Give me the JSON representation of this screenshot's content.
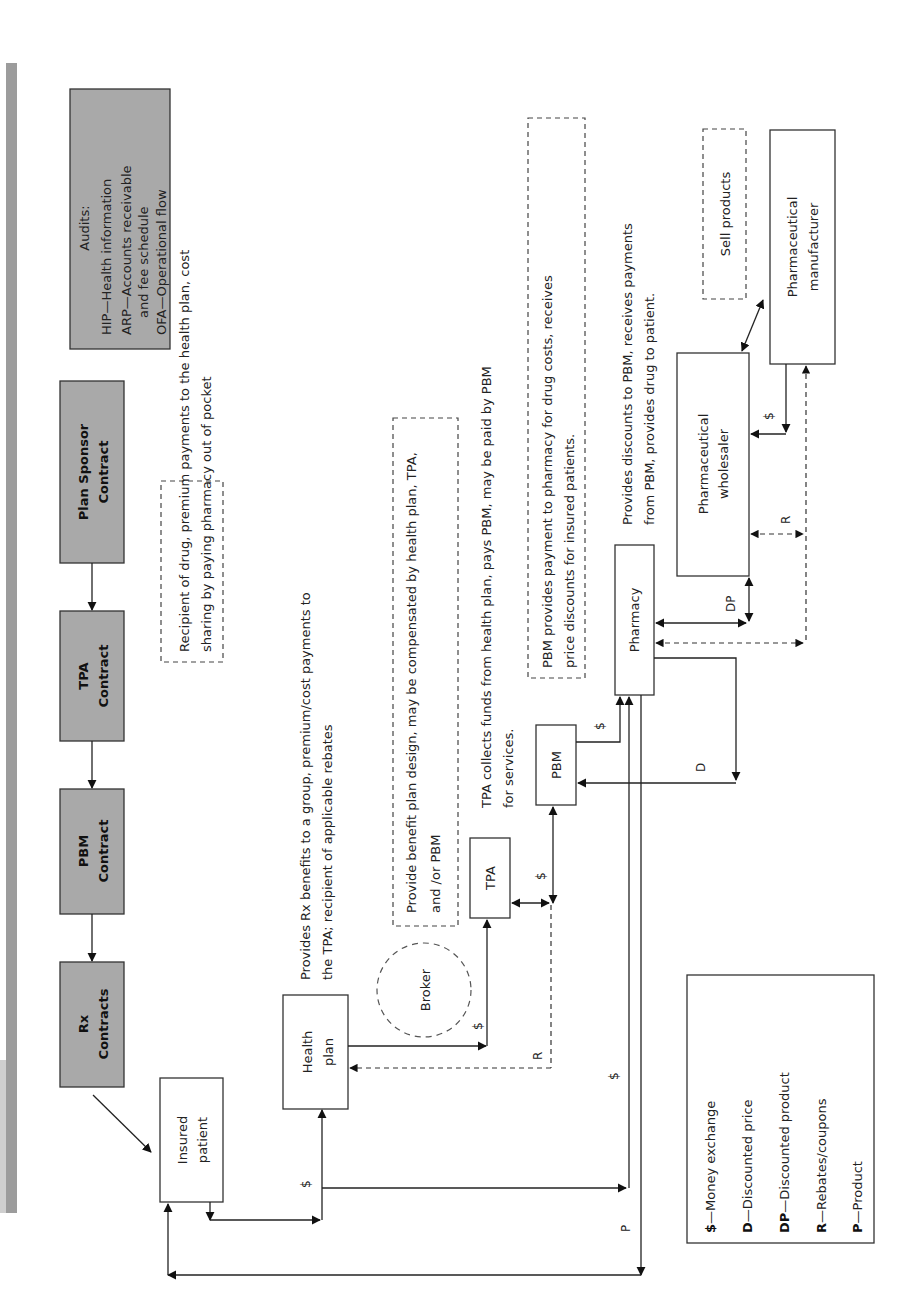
{
  "contracts": {
    "plan_sponsor": [
      "Plan Sponsor",
      "Contract"
    ],
    "tpa": [
      "TPA",
      "Contract"
    ],
    "pbm": [
      "PBM",
      "Contract"
    ],
    "rx": [
      "Rx",
      "Contracts"
    ]
  },
  "audits": {
    "title": "Audits:",
    "items": [
      [
        "HIP—Health information"
      ],
      [
        "ARP—Accounts receivable",
        "and fee schedule"
      ],
      [
        "OFA—Operational flow"
      ]
    ]
  },
  "entities": {
    "insured_patient": [
      "Insured",
      "patient"
    ],
    "health_plan": [
      "Health",
      "plan"
    ],
    "broker": "Broker",
    "tpa": "TPA",
    "pbm": "PBM",
    "pharmacy": "Pharmacy",
    "wholesaler": [
      "Pharmaceutical",
      "wholesaler"
    ],
    "manufacturer": [
      "Pharmaceutical",
      "manufacturer"
    ]
  },
  "descriptions": {
    "patient": [
      "Recipient of drug, premium payments to the health plan, cost",
      "sharing by paying pharmacy out of pocket"
    ],
    "health_plan": [
      "Provides Rx benefits to a group, premium/cost payments to",
      "the TPA; recipient of applicable rebates"
    ],
    "broker": [
      "Provide benefit plan design, may be compensated by health plan, TPA,",
      "and /or PBM"
    ],
    "tpa": [
      "TPA collects funds from health plan, pays PBM, may be paid by PBM",
      "for services."
    ],
    "pbm": [
      "PBM provides payment to pharmacy for drug costs, receives",
      "price discounts for insured patients."
    ],
    "wholesaler": [
      "Provides discounts to PBM, receives payments",
      "from PBM, provides drug to patient."
    ],
    "manufacturer": [
      "Sell products"
    ]
  },
  "flow_labels": {
    "money": "$",
    "discounted_price": "D",
    "discounted_product": "DP",
    "rebates": "R",
    "product": "P"
  },
  "legend": [
    {
      "key": "$",
      "text": "—Money exchange"
    },
    {
      "key": "D",
      "text": "—Discounted price"
    },
    {
      "key": "DP",
      "text": "—Discounted product"
    },
    {
      "key": "R",
      "text": "—Rebates/coupons"
    },
    {
      "key": "P",
      "text": "—Product"
    }
  ]
}
